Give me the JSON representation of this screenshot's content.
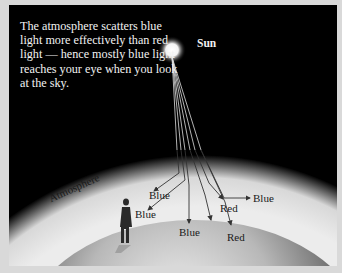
{
  "caption": "The atmosphere scatters blue light more effectively than red light — hence mostly blue light reaches your eye when you look at the sky.",
  "labels": {
    "sun": "Sun",
    "atmosphere": "Atmosphere",
    "rays": [
      {
        "text": "Blue",
        "id": "blue-upper-left"
      },
      {
        "text": "Blue",
        "id": "blue-lower-left"
      },
      {
        "text": "Blue",
        "id": "blue-bottom"
      },
      {
        "text": "Red",
        "id": "red-upper"
      },
      {
        "text": "Red",
        "id": "red-lower"
      },
      {
        "text": "Blue",
        "id": "blue-right"
      }
    ]
  },
  "colors": {
    "sky": "#000000",
    "atmosphere": "#e8e8e8",
    "earth": "#9a9a9a",
    "frame": "#d9d9d9"
  }
}
